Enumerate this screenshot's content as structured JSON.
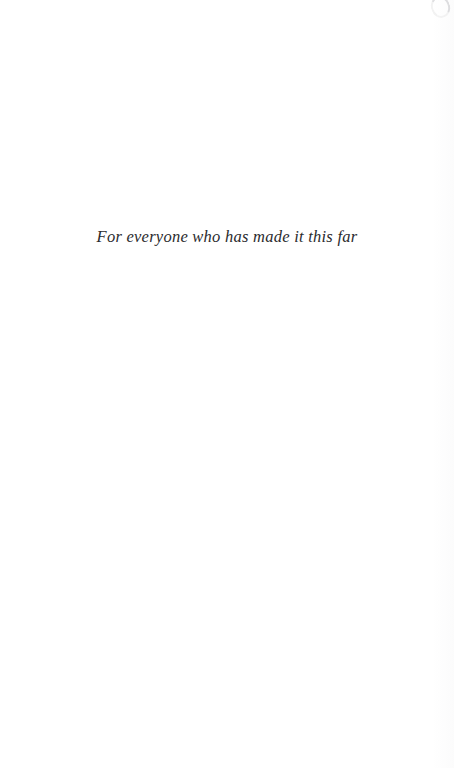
{
  "page": {
    "kind": "book-dedication-page",
    "background_color": "#ffffff"
  },
  "dedication": {
    "text": "For everyone who has made it this far",
    "text_color": "#2b2b2e",
    "alignment": "center"
  },
  "artifacts": {
    "top_right_smudge": "scan-smudge",
    "right_edge_tint": "scan-edge-shadow"
  }
}
